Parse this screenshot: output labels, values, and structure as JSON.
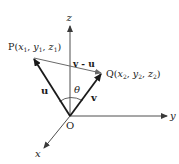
{
  "diagram": {
    "axes": {
      "x_label": "x",
      "y_label": "y",
      "z_label": "z",
      "origin_label": "O"
    },
    "points": {
      "P": {
        "name": "P",
        "coords": [
          "x",
          "y",
          "z"
        ],
        "subscript": "1"
      },
      "Q": {
        "name": "Q",
        "coords": [
          "x",
          "y",
          "z"
        ],
        "subscript": "2"
      }
    },
    "vectors": {
      "u_label": "u",
      "v_label": "v",
      "diff_label": "v - u"
    },
    "angle_label": "θ",
    "colors": {
      "stroke": "#1a1a1a",
      "axis": "#3a3a3a",
      "diff": "#6a6a6a",
      "background": "#ffffff"
    }
  }
}
